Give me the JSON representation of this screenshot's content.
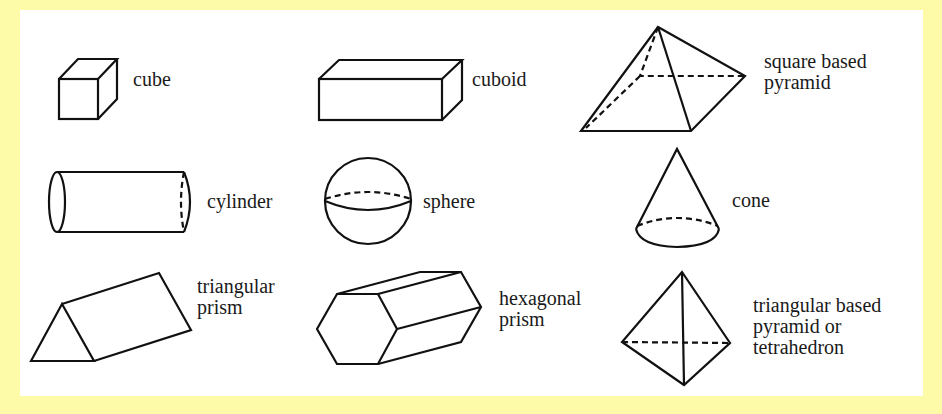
{
  "colors": {
    "background": "#fdfaa8",
    "panel": "#ffffff",
    "stroke": "#111111",
    "text": "#1a1a1a"
  },
  "shapes": [
    {
      "id": "cube",
      "label_lines": [
        "cube"
      ],
      "row": 1,
      "col": 1
    },
    {
      "id": "cuboid",
      "label_lines": [
        "cuboid"
      ],
      "row": 1,
      "col": 2
    },
    {
      "id": "square-based-pyramid",
      "label_lines": [
        "square based",
        "pyramid"
      ],
      "row": 1,
      "col": 3
    },
    {
      "id": "cylinder",
      "label_lines": [
        "cylinder"
      ],
      "row": 2,
      "col": 1
    },
    {
      "id": "sphere",
      "label_lines": [
        "sphere"
      ],
      "row": 2,
      "col": 2
    },
    {
      "id": "cone",
      "label_lines": [
        "cone"
      ],
      "row": 2,
      "col": 3
    },
    {
      "id": "triangular-prism",
      "label_lines": [
        "triangular",
        "prism"
      ],
      "row": 3,
      "col": 1
    },
    {
      "id": "hexagonal-prism",
      "label_lines": [
        "hexagonal",
        "prism"
      ],
      "row": 3,
      "col": 2
    },
    {
      "id": "tetrahedron",
      "label_lines": [
        "triangular based",
        "pyramid or",
        "tetrahedron"
      ],
      "row": 3,
      "col": 3
    }
  ]
}
